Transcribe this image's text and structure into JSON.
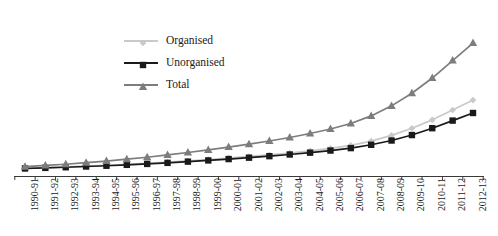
{
  "chart_data": {
    "type": "line",
    "title": "",
    "subtitle": "",
    "xlabel": "",
    "ylabel": "",
    "grid": false,
    "legend_position": "top-center-left",
    "axis": {
      "x_axis_visible": true,
      "y_axis_visible": false,
      "ticks_between_categories": true
    },
    "ylim": [
      0,
      100
    ],
    "categories": [
      "1990-91",
      "1991-92",
      "1992-93",
      "1993-94",
      "1994-95",
      "1995-96",
      "1996-97",
      "1997-98",
      "1998-99",
      "1999-00",
      "2000-01",
      "2001-02",
      "2002-03",
      "2003-04",
      "2004-05",
      "2005-06",
      "2006-07",
      "2007-08",
      "2008-09",
      "2009-10",
      "2010-11",
      "2011-12",
      "2012-13"
    ],
    "series": [
      {
        "name": "Organised",
        "color": "#c9c9c9",
        "marker": "diamond",
        "values": [
          1.2,
          1.6,
          2.0,
          2.5,
          3.1,
          3.7,
          4.4,
          5.2,
          6.0,
          6.9,
          7.9,
          8.9,
          10.0,
          11.2,
          12.6,
          14.2,
          16.2,
          19.0,
          22.8,
          27.5,
          33.0,
          39.5,
          46.0
        ]
      },
      {
        "name": "Unorganised",
        "color": "#1a1a1a",
        "marker": "square",
        "values": [
          1.0,
          1.4,
          1.8,
          2.3,
          2.8,
          3.4,
          4.0,
          4.7,
          5.5,
          6.3,
          7.2,
          8.1,
          9.1,
          10.2,
          11.4,
          12.8,
          14.4,
          16.6,
          19.4,
          23.0,
          27.5,
          32.5,
          37.5
        ]
      },
      {
        "name": "Total",
        "color": "#7d7d7d",
        "marker": "triangle",
        "values": [
          2.2,
          3.0,
          3.8,
          4.8,
          5.9,
          7.1,
          8.4,
          9.9,
          11.5,
          13.2,
          15.1,
          17.0,
          19.1,
          21.4,
          24.0,
          27.0,
          30.6,
          35.6,
          42.2,
          50.5,
          60.5,
          72.0,
          83.5
        ]
      }
    ]
  },
  "legend": {
    "items": [
      {
        "label": "Organised"
      },
      {
        "label": "Unorganised"
      },
      {
        "label": "Total"
      }
    ]
  }
}
